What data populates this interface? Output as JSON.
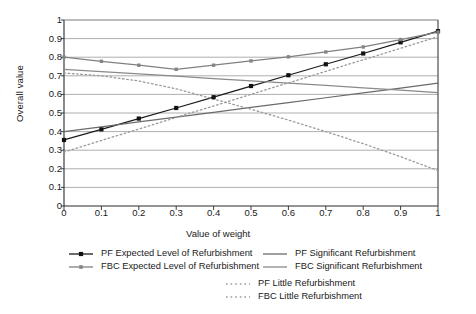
{
  "chart_data": {
    "type": "line",
    "title": "",
    "xlabel": "Value of weight",
    "ylabel": "Overall value",
    "xlim": [
      0,
      1
    ],
    "ylim": [
      0,
      1
    ],
    "xticks": [
      "0",
      "0.1",
      "0.2",
      "0.3",
      "0.4",
      "0.5",
      "0.6",
      "0.7",
      "0.8",
      "0.9",
      "1"
    ],
    "yticks": [
      "0",
      "0.1",
      "0.2",
      "0.3",
      "0.4",
      "0.5",
      "0.6",
      "0.7",
      "0.8",
      "0.9",
      "1"
    ],
    "grid": "horizontal",
    "legend_position": "below",
    "x": [
      0,
      0.1,
      0.2,
      0.3,
      0.4,
      0.5,
      0.6,
      0.7,
      0.8,
      0.9,
      1
    ],
    "series": [
      {
        "name": "PF Expected Level of Refurbishment",
        "color": "#1b1b1b",
        "style": "solid",
        "marker": "square-filled-black",
        "values": [
          0.355,
          0.412,
          0.47,
          0.527,
          0.585,
          0.645,
          0.703,
          0.762,
          0.82,
          0.88,
          0.94
        ]
      },
      {
        "name": "FBC Expected Level of Refurbishment",
        "color": "#808080",
        "style": "solid",
        "marker": "square-filled-gray",
        "values": [
          0.8,
          0.778,
          0.757,
          0.735,
          0.757,
          0.78,
          0.802,
          0.828,
          0.855,
          0.895,
          0.935
        ]
      },
      {
        "name": "PF Significant Refurbishment",
        "color": "#6b6b6b",
        "style": "solid",
        "marker": "none",
        "values": [
          0.4,
          0.426,
          0.452,
          0.478,
          0.504,
          0.53,
          0.556,
          0.582,
          0.608,
          0.634,
          0.66
        ]
      },
      {
        "name": "FBC Significant Refurbishment",
        "color": "#8a8a8a",
        "style": "solid",
        "marker": "none",
        "values": [
          0.735,
          0.723,
          0.71,
          0.698,
          0.685,
          0.673,
          0.66,
          0.648,
          0.635,
          0.623,
          0.61
        ]
      },
      {
        "name": "PF Little Refurbishment",
        "color": "#9a9a9a",
        "style": "dotted",
        "marker": "none",
        "values": [
          0.29,
          0.352,
          0.414,
          0.476,
          0.538,
          0.6,
          0.662,
          0.724,
          0.786,
          0.848,
          0.91
        ]
      },
      {
        "name": "FBC Little Refurbishment",
        "color": "#9a9a9a",
        "style": "dotted",
        "marker": "none",
        "values": [
          0.715,
          0.7,
          0.672,
          0.63,
          0.575,
          0.52,
          0.462,
          0.4,
          0.335,
          0.265,
          0.19
        ]
      }
    ]
  },
  "legend": {
    "entries": [
      {
        "label": "PF Expected Level of Refurbishment",
        "col": 0,
        "row": 0
      },
      {
        "label": "FBC Expected Level of Refurbishment",
        "col": 0,
        "row": 1
      },
      {
        "label": "PF Significant Refurbishment",
        "col": 1,
        "row": 0
      },
      {
        "label": "FBC Significant Refurbishment",
        "col": 1,
        "row": 1
      },
      {
        "label": "PF Little Refurbishment",
        "col": 2,
        "row": 2
      },
      {
        "label": "FBC Little Refurbishment",
        "col": 2,
        "row": 3
      }
    ]
  }
}
